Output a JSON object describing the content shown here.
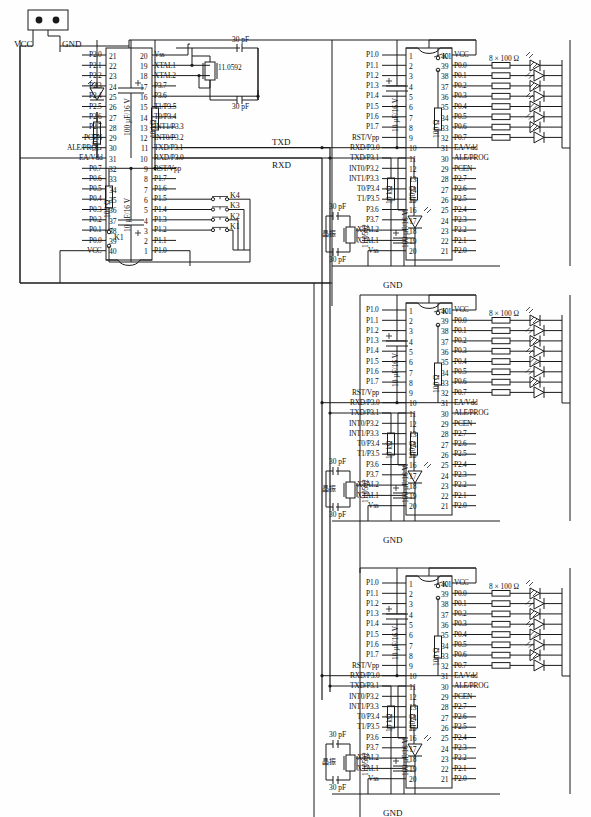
{
  "diagram": {
    "power_connector": {
      "name": "power-header",
      "pins": [
        "VCC",
        "GND"
      ]
    },
    "bus_labels": {
      "txd": "TXD",
      "rxd": "RXD"
    },
    "ground_label": "GND",
    "vcc_label": "VCC",
    "crystal": {
      "value": "11.0592",
      "cjk_label": "晶振",
      "caps": "30 pF"
    },
    "led_bank_label": "8 × 100 Ω"
  },
  "master": {
    "name": "master-mcu",
    "left_pins": [
      {
        "label": "P2.0",
        "num": "21"
      },
      {
        "label": "P2.1",
        "num": "22"
      },
      {
        "label": "P2.2",
        "num": "23"
      },
      {
        "label": "P2.3",
        "num": "24"
      },
      {
        "label": "P2.4",
        "num": "25"
      },
      {
        "label": "P2.5",
        "num": "26"
      },
      {
        "label": "P2.6",
        "num": "27"
      },
      {
        "label": "P2.7",
        "num": "28"
      },
      {
        "label": "PCEN",
        "num": "29"
      },
      {
        "label": "ALE/PROG",
        "num": "30"
      },
      {
        "label": "EA/Vdd",
        "num": "31"
      },
      {
        "label": "P0.7",
        "num": "32"
      },
      {
        "label": "P0.6",
        "num": "33"
      },
      {
        "label": "P0.5",
        "num": "34"
      },
      {
        "label": "P0.4",
        "num": "35"
      },
      {
        "label": "P0.3",
        "num": "36"
      },
      {
        "label": "P0.2",
        "num": "37"
      },
      {
        "label": "P0.1",
        "num": "38"
      },
      {
        "label": "P0.0",
        "num": "39"
      },
      {
        "label": "VCC",
        "num": "40"
      }
    ],
    "right_pins": [
      {
        "label": "Vss",
        "num": "20"
      },
      {
        "label": "XTAL1",
        "num": "19"
      },
      {
        "label": "XTAL2",
        "num": "18"
      },
      {
        "label": "P3.7",
        "num": "17"
      },
      {
        "label": "P3.6",
        "num": "16"
      },
      {
        "label": "T1/P3.5",
        "num": "15"
      },
      {
        "label": "T0/P3.4",
        "num": "14"
      },
      {
        "label": "INT1/P3.3",
        "num": "13"
      },
      {
        "label": "INT0/P3.2",
        "num": "12"
      },
      {
        "label": "TXD/P3.1",
        "num": "11"
      },
      {
        "label": "RXD/P3.0",
        "num": "10"
      },
      {
        "label": "RST/Vpp",
        "num": "9"
      },
      {
        "label": "P1.7",
        "num": "8"
      },
      {
        "label": "P1.6",
        "num": "7"
      },
      {
        "label": "P1.5",
        "num": "6"
      },
      {
        "label": "P1.4",
        "num": "5"
      },
      {
        "label": "P1.3",
        "num": "4"
      },
      {
        "label": "P1.2",
        "num": "3"
      },
      {
        "label": "P1.1",
        "num": "2"
      },
      {
        "label": "P1.0",
        "num": "1"
      }
    ],
    "components": {
      "c_reset": "10 µF/16 V",
      "c_led": "100 µF/16 V",
      "r_pullup": "10 kΩ",
      "r_led": "100 Ω",
      "r_reset": "100 Ω",
      "key_reset": "K1"
    },
    "keys": [
      "K4",
      "K3",
      "K2",
      "K1"
    ],
    "key_pins": [
      "P1.4",
      "P1.3",
      "P1.2",
      "P1.1"
    ]
  },
  "slave_template": {
    "name": "slave-mcu",
    "left_pins": [
      {
        "label": "P1.0",
        "num": "1"
      },
      {
        "label": "P1.1",
        "num": "2"
      },
      {
        "label": "P1.2",
        "num": "3"
      },
      {
        "label": "P1.3",
        "num": "4"
      },
      {
        "label": "P1.4",
        "num": "5"
      },
      {
        "label": "P1.5",
        "num": "6"
      },
      {
        "label": "P1.6",
        "num": "7"
      },
      {
        "label": "P1.7",
        "num": "8"
      },
      {
        "label": "RST/Vpp",
        "num": "9"
      },
      {
        "label": "RXD/P3.0",
        "num": "10"
      },
      {
        "label": "TXD/P3.1",
        "num": "11"
      },
      {
        "label": "INT0/P3.2",
        "num": "12"
      },
      {
        "label": "INT1/P3.3",
        "num": "13"
      },
      {
        "label": "T0/P3.4",
        "num": "14"
      },
      {
        "label": "T1/P3.5",
        "num": "15"
      },
      {
        "label": "P3.6",
        "num": "16"
      },
      {
        "label": "P3.7",
        "num": "17"
      },
      {
        "label": "XTAL2",
        "num": "18"
      },
      {
        "label": "XTAL1",
        "num": "19"
      },
      {
        "label": "Vss",
        "num": "20"
      }
    ],
    "right_pins": [
      {
        "label": "VCC",
        "num": "40"
      },
      {
        "label": "P0.0",
        "num": "39"
      },
      {
        "label": "P0.1",
        "num": "38"
      },
      {
        "label": "P0.2",
        "num": "37"
      },
      {
        "label": "P0.3",
        "num": "36"
      },
      {
        "label": "P0.4",
        "num": "35"
      },
      {
        "label": "P0.5",
        "num": "34"
      },
      {
        "label": "P0.6",
        "num": "33"
      },
      {
        "label": "P0.7",
        "num": "32"
      },
      {
        "label": "EA/Vdd",
        "num": "31"
      },
      {
        "label": "ALE/PROG",
        "num": "30"
      },
      {
        "label": "PCEN",
        "num": "29"
      },
      {
        "label": "P2.7",
        "num": "28"
      },
      {
        "label": "P2.6",
        "num": "27"
      },
      {
        "label": "P2.5",
        "num": "26"
      },
      {
        "label": "P2.4",
        "num": "25"
      },
      {
        "label": "P2.3",
        "num": "24"
      },
      {
        "label": "P2.2",
        "num": "23"
      },
      {
        "label": "P2.1",
        "num": "22"
      },
      {
        "label": "P2.0",
        "num": "21"
      }
    ],
    "components": {
      "c_reset": "10 µF/16 V",
      "c_led": "100 µF/16 V",
      "r_pullup": "10 kΩ",
      "r_reset": "100 Ω",
      "r_led": "100 Ω",
      "key_reset": "K1",
      "led_bank": "8 × 100 Ω"
    }
  },
  "slaves": [
    {
      "id": "slave-1",
      "key_reset": "K1"
    },
    {
      "id": "slave-2",
      "key_reset": "K1"
    },
    {
      "id": "slave-3",
      "key_reset": "K1"
    }
  ]
}
